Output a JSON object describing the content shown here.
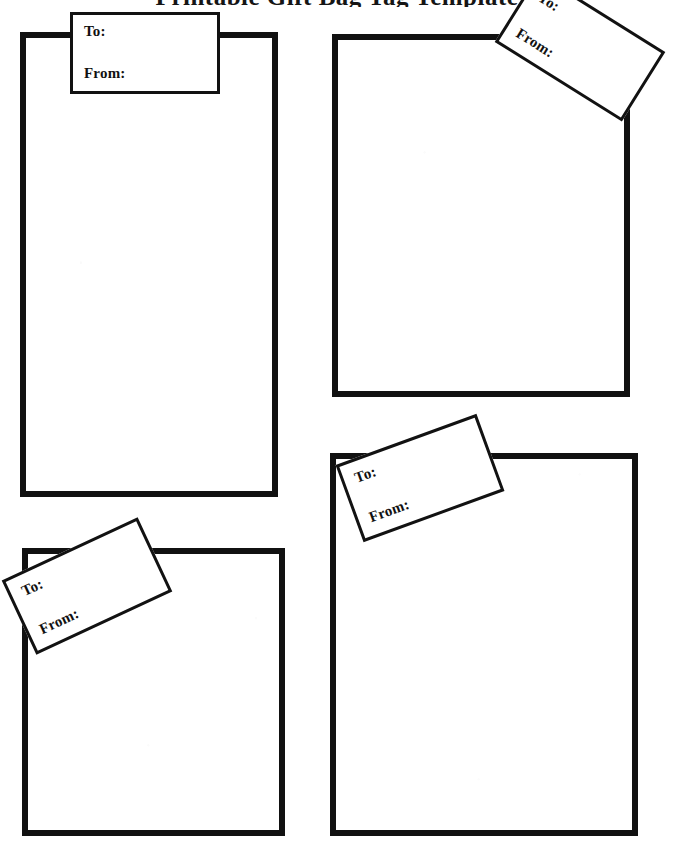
{
  "page": {
    "title": "Printable Gift Bag Tag Template",
    "title_note": "cropped at top edge of scan",
    "background_color": "#ffffff",
    "ink_color": "#111111",
    "width": 674,
    "height": 847
  },
  "tag_labels": {
    "to": "To:",
    "from": "From:"
  },
  "panels": [
    {
      "id": "panel-1",
      "name": "top-left-bag",
      "x": 20,
      "y": 32,
      "w": 258,
      "h": 465,
      "tag": {
        "x": 70,
        "y": 12,
        "w": 150,
        "h": 82,
        "rotation": 0
      }
    },
    {
      "id": "panel-2",
      "name": "top-right-bag",
      "x": 332,
      "y": 34,
      "w": 298,
      "h": 363,
      "tag": {
        "x": 505,
        "y": 6,
        "w": 150,
        "h": 82,
        "rotation": 32
      }
    },
    {
      "id": "panel-3",
      "name": "bottom-left-bag",
      "x": 22,
      "y": 548,
      "w": 263,
      "h": 288,
      "tag": {
        "x": 12,
        "y": 545,
        "w": 150,
        "h": 82,
        "rotation": -25
      }
    },
    {
      "id": "panel-4",
      "name": "bottom-right-bag",
      "x": 330,
      "y": 453,
      "w": 308,
      "h": 383,
      "tag": {
        "x": 345,
        "y": 437,
        "w": 150,
        "h": 82,
        "rotation": -20
      }
    }
  ]
}
